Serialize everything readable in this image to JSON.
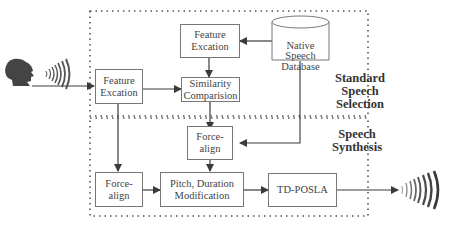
{
  "diagram": {
    "regions": {
      "selection": {
        "label": "Standard\nSpeech\nSelection"
      },
      "synthesis": {
        "label": "Speech\nSynthesis"
      }
    },
    "nodes": {
      "feature_excation_top": {
        "label": "Feature\nExcation"
      },
      "native_speech_database": {
        "label": "Native\nSpeech\nDatabase"
      },
      "feature_excation_left": {
        "label": "Feature\nExcation"
      },
      "similarity_comparision": {
        "label": "Similarity\nComparision"
      },
      "force_align_middle": {
        "label": "Force-\nalign"
      },
      "force_align_left": {
        "label": "Force-\nalign"
      },
      "pitch_duration_modification": {
        "label": "Pitch, Duration\nModification"
      },
      "td_posla": {
        "label": "TD-POSLA"
      }
    },
    "icons": {
      "input": "speaking-head-icon",
      "output": "sound-waves-icon"
    },
    "edges": [
      {
        "from": "speaking-head",
        "to": "feature_excation_left"
      },
      {
        "from": "native_speech_database",
        "to": "feature_excation_top"
      },
      {
        "from": "feature_excation_top",
        "to": "similarity_comparision"
      },
      {
        "from": "feature_excation_left",
        "to": "similarity_comparision"
      },
      {
        "from": "similarity_comparision",
        "to": "force_align_middle"
      },
      {
        "from": "native_speech_database",
        "to": "force_align_middle"
      },
      {
        "from": "feature_excation_left",
        "to": "force_align_left"
      },
      {
        "from": "force_align_left",
        "to": "pitch_duration_modification"
      },
      {
        "from": "force_align_middle",
        "to": "pitch_duration_modification"
      },
      {
        "from": "pitch_duration_modification",
        "to": "td_posla"
      },
      {
        "from": "td_posla",
        "to": "output-sound-waves"
      }
    ],
    "colors": {
      "line": "#3a3a3a",
      "box_border": "#777777",
      "icon": "#444444"
    }
  }
}
